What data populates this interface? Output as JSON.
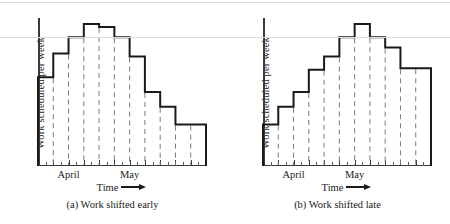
{
  "figure": {
    "axis": {
      "ylabel": "Work scheduled per week",
      "time_label": "Time",
      "time_arrow": "⟶",
      "month_labels": [
        "April",
        "May"
      ]
    },
    "ink_color": "#1a1a1a",
    "axis_color": "#3a3a3a",
    "dash_color": "#7a7a7a"
  },
  "chart_data": [
    {
      "type": "bar",
      "panel_id": "a",
      "title": "(a)  Work shifted early",
      "xlabel": "Time",
      "ylabel": "Work scheduled per week",
      "categories": [
        "1",
        "2",
        "3",
        "4",
        "5",
        "6",
        "7",
        "8",
        "9",
        "10",
        "11"
      ],
      "values": [
        0.6,
        0.76,
        0.87,
        0.96,
        0.94,
        0.87,
        0.74,
        0.5,
        0.4,
        0.28,
        0.28
      ],
      "ylim": [
        0,
        1
      ],
      "grid": false,
      "legend": null,
      "tick_labels": {
        "April": 2.0,
        "May": 6.0
      },
      "annotations": [
        "step histogram outline",
        "dashed weekly dividers"
      ]
    },
    {
      "type": "bar",
      "panel_id": "b",
      "title": "(b)  Work shifted late",
      "xlabel": "Time",
      "ylabel": "Work scheduled per week",
      "categories": [
        "1",
        "2",
        "3",
        "4",
        "5",
        "6",
        "7",
        "8",
        "9",
        "10",
        "11"
      ],
      "values": [
        0.28,
        0.4,
        0.5,
        0.65,
        0.74,
        0.87,
        0.96,
        0.87,
        0.8,
        0.66,
        0.66
      ],
      "ylim": [
        0,
        1
      ],
      "grid": false,
      "legend": null,
      "tick_labels": {
        "April": 2.0,
        "May": 6.0
      },
      "annotations": [
        "step histogram outline",
        "dashed weekly dividers"
      ]
    }
  ],
  "panels": [
    {
      "caption": "(a)  Work shifted early",
      "ylabel": "Work scheduled per week",
      "time_label": "Time",
      "months": [
        "April",
        "May"
      ]
    },
    {
      "caption": "(b)  Work shifted late",
      "ylabel": "Work scheduled per week",
      "time_label": "Time",
      "months": [
        "April",
        "May"
      ]
    }
  ]
}
